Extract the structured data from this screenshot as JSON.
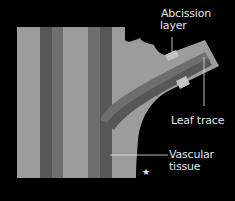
{
  "diagram": {
    "colors": {
      "background": "#000000",
      "light_tissue": "#9c9c9c",
      "vascular_medium": "#6e6e6e",
      "vascular_dark": "#555555",
      "abscission": "#c4c4c4",
      "label": "#e6e6e6"
    },
    "labels": {
      "abscission": [
        "Abcission",
        "layer"
      ],
      "leaf_trace": "Leaf trace",
      "vascular": [
        "Vascular",
        "tissue"
      ]
    },
    "marker": "★"
  }
}
